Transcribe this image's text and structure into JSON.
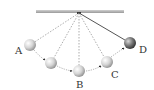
{
  "diagram": {
    "type": "pendulum-swing",
    "ceiling": {
      "x1": 36,
      "x2": 124,
      "y": 10,
      "height": 3,
      "color": "#a8a8a8"
    },
    "pivot": {
      "x": 79,
      "y": 13
    },
    "colors": {
      "dashed_string": "#888888",
      "solid_string": "#555555",
      "arrow": "#222222",
      "label": "#333333"
    },
    "positions": [
      {
        "id": "A",
        "label": "A",
        "x": 30,
        "y": 45,
        "label_x": 19,
        "label_y": 53,
        "shade": "light"
      },
      {
        "id": "A2",
        "label": "",
        "x": 51,
        "y": 63,
        "shade": "light"
      },
      {
        "id": "B",
        "label": "B",
        "x": 79,
        "y": 71,
        "label_x": 79,
        "label_y": 88,
        "shade": "light"
      },
      {
        "id": "C",
        "label": "C",
        "x": 107,
        "y": 62,
        "label_x": 115,
        "label_y": 78,
        "shade": "light"
      },
      {
        "id": "D",
        "label": "D",
        "x": 130,
        "y": 43,
        "label_x": 145,
        "label_y": 52,
        "shade": "dark"
      }
    ],
    "labels": {
      "A": "A",
      "B": "B",
      "C": "C",
      "D": "D"
    }
  }
}
